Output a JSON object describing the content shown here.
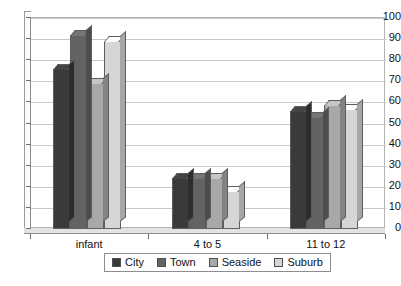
{
  "chart_data": {
    "type": "bar",
    "title": "",
    "subtitle": "",
    "xlabel": "",
    "ylabel": "",
    "categories": [
      "infant",
      "4 to 5",
      "11 to 12"
    ],
    "series": [
      {
        "name": "City",
        "color": "#3a3a3a",
        "values": [
          76,
          24,
          56
        ]
      },
      {
        "name": "Town",
        "color": "#636363",
        "values": [
          92,
          24,
          53
        ]
      },
      {
        "name": "Seaside",
        "color": "#a8a8a8",
        "values": [
          69,
          24,
          59
        ]
      },
      {
        "name": "Suburb",
        "color": "#d6d6d6",
        "values": [
          89,
          18,
          57
        ]
      }
    ],
    "ylim": [
      0,
      100
    ],
    "ytick_step": 10,
    "yticks": [
      0,
      10,
      20,
      30,
      40,
      50,
      60,
      70,
      80,
      90,
      100
    ],
    "ytick_labels": [
      "0",
      "10",
      "20",
      "30",
      "40",
      "50",
      "60",
      "70",
      "80",
      "90",
      "100"
    ],
    "grid": true,
    "grid_axis": "y",
    "legend_position": "bottom",
    "style": "3d-column",
    "background_color": "#ffffff",
    "gridline_color": "#c9c9c9",
    "axis_color": "#8a8a8a"
  },
  "legend": {
    "items": [
      {
        "label": "City"
      },
      {
        "label": "Town"
      },
      {
        "label": "Seaside"
      },
      {
        "label": "Suburb"
      }
    ]
  }
}
